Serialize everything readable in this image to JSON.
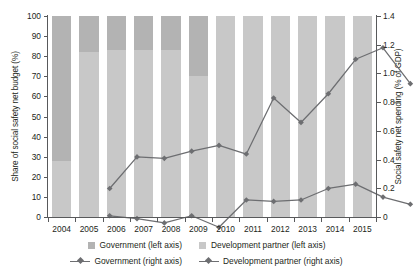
{
  "chart_data": {
    "type": "bar",
    "title": "",
    "subtitle": "",
    "categories": [
      "2004",
      "2005",
      "2006",
      "2007",
      "2008",
      "2009",
      "2010",
      "2011",
      "2012",
      "2013",
      "2014",
      "2015"
    ],
    "xlabel": "",
    "ylabel": "Share of social safety net budget (%)",
    "ylabel_right": "Social safety net spending (% of GDP)",
    "ylim": [
      0,
      100
    ],
    "ylim_right": [
      0,
      1.4
    ],
    "yticks": [
      "100",
      "90",
      "80",
      "70",
      "60",
      "50",
      "40",
      "30",
      "20",
      "10",
      "0"
    ],
    "ytick_values": [
      100,
      90,
      80,
      70,
      60,
      50,
      40,
      30,
      20,
      10,
      0
    ],
    "yticks_right": [
      "1.4",
      "1.2",
      "1.0",
      "0.8",
      "0.6",
      "0.4",
      "0.2",
      "0"
    ],
    "ytick_values_right": [
      1.4,
      1.2,
      1.0,
      0.8,
      0.6,
      0.4,
      0.2,
      0
    ],
    "grid": false,
    "legend_position": "bottom",
    "series": [
      {
        "name": "Government (left axis)",
        "type": "bar-stack",
        "axis": "left",
        "color": "#b3b3b3",
        "values": [
          28,
          82,
          83,
          83,
          83,
          70,
          100,
          100,
          100,
          100,
          100,
          100
        ]
      },
      {
        "name": "Development partner (left axis)",
        "type": "bar-stack",
        "axis": "left",
        "color": "#c8c8c8",
        "values": [
          72,
          18,
          17,
          17,
          17,
          30,
          0,
          0,
          0,
          0,
          0,
          0
        ]
      },
      {
        "name": "Government (right axis)",
        "type": "line",
        "axis": "right",
        "color": "#6d6e71",
        "values": [
          0.31,
          0.53,
          0.52,
          0.57,
          0.61,
          0.55,
          0.94,
          0.77,
          0.97,
          1.21,
          1.29,
          1.04
        ]
      },
      {
        "name": "Development partner (right axis)",
        "type": "line",
        "axis": "right",
        "color": "#6d6e71",
        "values": [
          0.12,
          0.1,
          0.07,
          0.12,
          0.04,
          0.23,
          0.22,
          0.23,
          0.31,
          0.34,
          0.25,
          0.2
        ]
      }
    ]
  },
  "legend": {
    "row1": [
      {
        "label": "Government (left axis)",
        "swatch": "#b3b3b3"
      },
      {
        "label": "Development partner (left axis)",
        "swatch": "#c8c8c8"
      }
    ],
    "row2": [
      {
        "label": "Government (right axis)",
        "marker": "diamond-icon"
      },
      {
        "label": "Development partner (right axis)",
        "marker": "diamond-icon"
      }
    ]
  },
  "colors": {
    "bar_government": "#b3b3b3",
    "bar_development_partner": "#c8c8c8",
    "line": "#6d6e71",
    "axis": "#58595b",
    "text": "#231f20"
  }
}
